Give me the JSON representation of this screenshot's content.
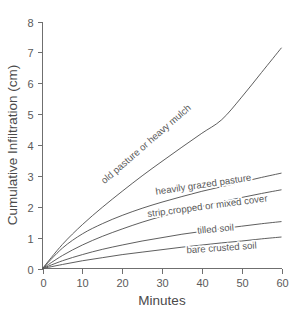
{
  "chart_data": {
    "type": "line",
    "title": "",
    "xlabel": "Minutes",
    "ylabel": "Cumulative Infiltration (cm)",
    "xlim": [
      0,
      60
    ],
    "ylim": [
      0,
      8
    ],
    "xticks": [
      0,
      10,
      20,
      30,
      40,
      50,
      60
    ],
    "yticks": [
      0,
      1,
      2,
      3,
      4,
      5,
      6,
      7,
      8
    ],
    "xtick_labels": [
      "0",
      "10",
      "20",
      "30",
      "40",
      "50",
      "60"
    ],
    "ytick_labels": [
      "0",
      "1",
      "2",
      "3",
      "4",
      "5",
      "6",
      "7",
      "8"
    ],
    "grid": false,
    "legend": "inline-curve-labels",
    "x": [
      0,
      5,
      10,
      15,
      20,
      25,
      30,
      35,
      40,
      45,
      50,
      55,
      60
    ],
    "series": [
      {
        "name": "old pasture or heavy mulch",
        "label": "old pasture or heavy mulch",
        "color": "#555555",
        "values": [
          0,
          0.78,
          1.42,
          1.98,
          2.5,
          3.0,
          3.47,
          3.93,
          4.38,
          4.82,
          5.55,
          6.35,
          7.15
        ]
      },
      {
        "name": "heavily grazed pasture",
        "label": "heavily grazed pasture",
        "color": "#555555",
        "values": [
          0,
          0.66,
          1.12,
          1.45,
          1.72,
          1.95,
          2.15,
          2.33,
          2.5,
          2.65,
          2.8,
          2.95,
          3.09
        ]
      },
      {
        "name": "strip cropped or mixed cover",
        "label": "strip cropped or mixed cover",
        "color": "#555555",
        "values": [
          0,
          0.42,
          0.76,
          1.04,
          1.28,
          1.5,
          1.69,
          1.86,
          2.01,
          2.16,
          2.3,
          2.43,
          2.55
        ]
      },
      {
        "name": "tilled soil",
        "label": "tilled soil",
        "color": "#555555",
        "values": [
          0,
          0.25,
          0.45,
          0.62,
          0.76,
          0.89,
          1.0,
          1.11,
          1.2,
          1.29,
          1.37,
          1.45,
          1.52
        ]
      },
      {
        "name": "bare crusted soil",
        "label": "bare crusted soil",
        "color": "#555555",
        "values": [
          0,
          0.13,
          0.25,
          0.35,
          0.45,
          0.53,
          0.61,
          0.69,
          0.76,
          0.83,
          0.89,
          0.96,
          1.02
        ]
      }
    ],
    "annotations": [
      {
        "text": "old pasture or heavy mulch",
        "x": 26.5,
        "y": 3.95,
        "rotate": -41
      },
      {
        "text": "heavily grazed pasture",
        "x": 40.5,
        "y": 2.62,
        "rotate": -8.5
      },
      {
        "text": "strip cropped or mixed cover",
        "x": 41.5,
        "y": 1.92,
        "rotate": -7.5
      },
      {
        "text": "tilled soil",
        "x": 43.5,
        "y": 1.18,
        "rotate": -5
      },
      {
        "text": "bare crusted soil",
        "x": 45.0,
        "y": 0.57,
        "rotate": -4
      }
    ]
  }
}
